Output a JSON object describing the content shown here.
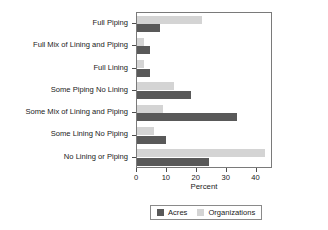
{
  "chart_data": {
    "type": "bar",
    "orientation": "horizontal",
    "title": "",
    "xlabel": "Percent",
    "ylabel": "",
    "xlim": [
      0,
      45.5
    ],
    "xticks": [
      0,
      10,
      20,
      30,
      40
    ],
    "xtick_labels": [
      "0",
      "10",
      "20",
      "30",
      "40"
    ],
    "grid": false,
    "legend_position": "bottom",
    "categories": [
      "Full Piping",
      "Full Mix of Lining and Piping",
      "Full Lining",
      "Some Piping No Lining",
      "Some Mix of Lining and Piping",
      "Some Lining No Piping",
      "No Lining or Piping"
    ],
    "series": [
      {
        "name": "Acres",
        "color": "#595959",
        "values": [
          7.6,
          4.5,
          4.5,
          18.0,
          33.4,
          9.8,
          24.0
        ]
      },
      {
        "name": "Organizations",
        "color": "#d4d4d4",
        "values": [
          21.7,
          2.5,
          2.5,
          12.4,
          8.8,
          5.6,
          42.7
        ]
      }
    ]
  },
  "legend": {
    "entries": [
      {
        "label": "Acres",
        "color": "#595959"
      },
      {
        "label": "Organizations",
        "color": "#d4d4d4"
      }
    ]
  },
  "axis": {
    "x_title": "Percent"
  }
}
